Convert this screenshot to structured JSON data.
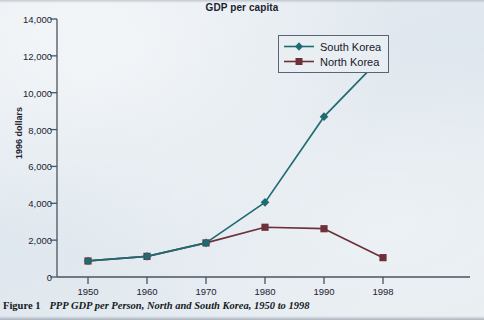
{
  "chart_data": {
    "type": "line",
    "title": "GDP per capita",
    "xlabel": "",
    "ylabel": "1996 dollars",
    "x": [
      1950,
      1960,
      1970,
      1980,
      1990,
      1998
    ],
    "categories": [
      "1950",
      "1960",
      "1970",
      "1980",
      "1990",
      "1998"
    ],
    "series": [
      {
        "name": "South Korea",
        "color": "#1f6b72",
        "marker": "diamond",
        "values": [
          870,
          1120,
          1850,
          4050,
          8700,
          12000
        ]
      },
      {
        "name": "North Korea",
        "color": "#6e3038",
        "marker": "square",
        "values": [
          870,
          1120,
          1850,
          2700,
          2620,
          1050
        ]
      }
    ],
    "ylim": [
      0,
      14000
    ],
    "y_ticks": [
      0,
      2000,
      4000,
      6000,
      8000,
      10000,
      12000,
      14000
    ],
    "y_tick_labels": [
      "0",
      "2,000",
      "4,000",
      "6,000",
      "8,000",
      "10,000",
      "12,000",
      "14,000"
    ],
    "grid": false,
    "legend_position": "top-right"
  },
  "legend": {
    "entries": [
      {
        "label": "South Korea"
      },
      {
        "label": "North Korea"
      }
    ]
  },
  "caption": {
    "label": "Figure 1",
    "text": "PPP GDP per Person, North and South Korea, 1950 to 1998"
  },
  "colors": {
    "south_korea": "#1f6b72",
    "north_korea": "#6e3038",
    "axis": "#4a5360",
    "text": "#1c2330",
    "background": "#e3eaf0"
  }
}
